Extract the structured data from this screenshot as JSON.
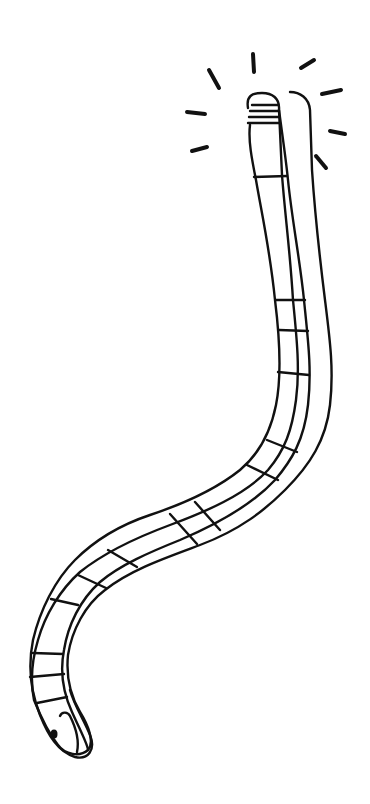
{
  "illustration": {
    "subject": "glowing worm line drawing",
    "ink_color": "#111111",
    "background_color": "#ffffff",
    "glow_ray_count": 8,
    "head_stripe_count": 4
  }
}
